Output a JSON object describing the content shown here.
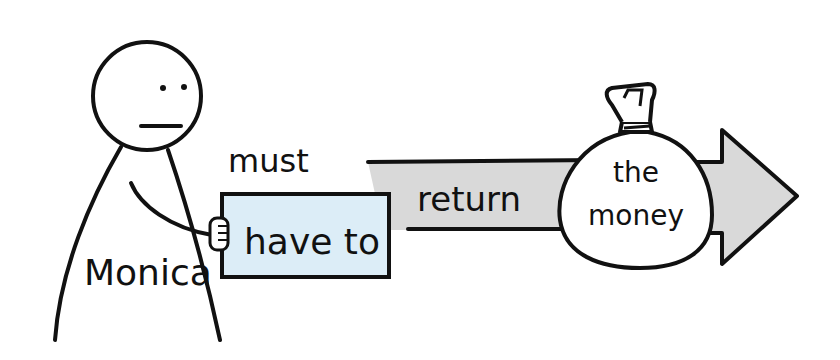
{
  "diagram": {
    "person_label": "Monica",
    "modal_top": "must",
    "modal_main": "have to",
    "verb": "return",
    "object_line1": "the",
    "object_line2": "money"
  },
  "colors": {
    "ink": "#111111",
    "sign_fill": "#dcedf7",
    "arrow_fill": "#d9d9d9",
    "background": "#ffffff"
  }
}
